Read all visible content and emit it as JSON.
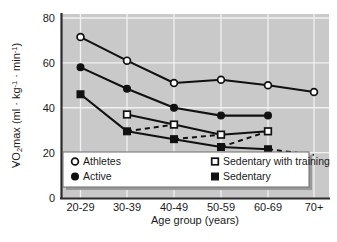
{
  "chart_data": {
    "type": "line",
    "title": "",
    "xlabel": "Age group (years)",
    "ylabel": "VO2max (ml · kg-1 · min-1)",
    "ylabel_parts": {
      "dotted_v": "V",
      "o": "O",
      "two": "2",
      "max": "max (ml · kg",
      "exp1": "-1",
      "middot": " · min",
      "exp2": "-1",
      "close": ")"
    },
    "categories": [
      "20-29",
      "30-39",
      "40-49",
      "50-59",
      "60-69",
      "70+"
    ],
    "ylim": [
      0,
      80
    ],
    "yticks": [
      "0",
      "20",
      "40",
      "60",
      "80"
    ],
    "ytick_values": [
      0,
      20,
      40,
      60,
      80
    ],
    "grid": true,
    "legend_position": "inside-bottom",
    "plot_background": "#c9c9c9",
    "line_color": "#111111",
    "series": [
      {
        "name": "Athletes",
        "marker": "open-circle",
        "linestyle": "solid",
        "x": [
          "20-29",
          "30-39",
          "40-49",
          "50-59",
          "60-69",
          "70+"
        ],
        "values": [
          71.5,
          61,
          51,
          52.5,
          50,
          47
        ]
      },
      {
        "name": "Active",
        "marker": "filled-circle",
        "linestyle": "solid",
        "x": [
          "20-29",
          "30-39",
          "40-49",
          "50-59",
          "60-69"
        ],
        "values": [
          58,
          48.5,
          40,
          36.5,
          36.5
        ]
      },
      {
        "name": "Sedentary with training",
        "marker": "open-square",
        "linestyle": "solid",
        "x": [
          "30-39",
          "40-49",
          "50-59",
          "60-69"
        ],
        "values": [
          37,
          32.5,
          28,
          29.5
        ]
      },
      {
        "name": "Sedentary",
        "marker": "filled-square",
        "linestyle": "solid",
        "x": [
          "20-29",
          "30-39",
          "40-49",
          "50-59",
          "60-69"
        ],
        "values": [
          46,
          29.5,
          26,
          22.5,
          21.5
        ]
      }
    ],
    "dashed_connectors": [
      {
        "from": {
          "x": "30-39",
          "y": 29.5
        },
        "to": {
          "x": "40-49",
          "y": 32.5
        }
      },
      {
        "from": {
          "x": "40-49",
          "y": 26
        },
        "to": {
          "x": "50-59",
          "y": 28
        }
      },
      {
        "from": {
          "x": "50-59",
          "y": 22.5
        },
        "to": {
          "x": "60-69",
          "y": 29.5
        }
      },
      {
        "from": {
          "x": "60-69",
          "y": 21.5
        },
        "to": {
          "x": "70+",
          "y": 19
        }
      }
    ],
    "legend": [
      {
        "label": "Athletes",
        "marker": "open-circle"
      },
      {
        "label": "Sedentary with training",
        "marker": "open-square"
      },
      {
        "label": "Active",
        "marker": "filled-circle"
      },
      {
        "label": "Sedentary",
        "marker": "filled-square"
      }
    ]
  }
}
